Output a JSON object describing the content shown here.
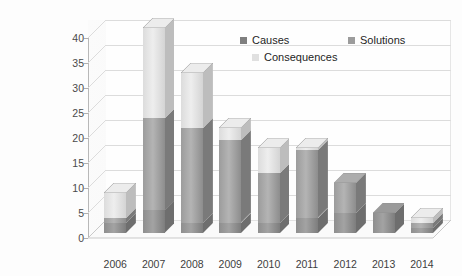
{
  "chart_data": {
    "type": "bar",
    "subtype": "stacked-column-3d",
    "title": "",
    "xlabel": "",
    "ylabel": "",
    "ylim": [
      0,
      40
    ],
    "ytick_step": 5,
    "yticks": [
      0,
      5,
      10,
      15,
      20,
      25,
      30,
      35,
      40
    ],
    "grid": true,
    "legend_position": "top-right",
    "categories": [
      "2006",
      "2007",
      "2008",
      "2009",
      "2010",
      "2011",
      "2012",
      "2013",
      "2014"
    ],
    "series": [
      {
        "name": "Causes",
        "color": "#7f7f7f",
        "values": [
          2,
          4.5,
          2,
          2,
          2,
          3,
          4,
          4,
          1
        ]
      },
      {
        "name": "Solutions",
        "color": "#9c9c9c",
        "values": [
          1,
          18.5,
          19,
          16.5,
          10,
          13.5,
          6,
          0,
          1
        ]
      },
      {
        "name": "Consequences",
        "color": "#e0e0e0",
        "values": [
          5,
          18,
          11,
          2.5,
          5,
          0.5,
          0,
          0,
          1
        ]
      }
    ],
    "totals": [
      8,
      41,
      32,
      21,
      17,
      17,
      10,
      4,
      3
    ]
  },
  "legend": {
    "items": [
      {
        "label": "Causes"
      },
      {
        "label": "Solutions"
      },
      {
        "label": "Consequences"
      }
    ]
  }
}
